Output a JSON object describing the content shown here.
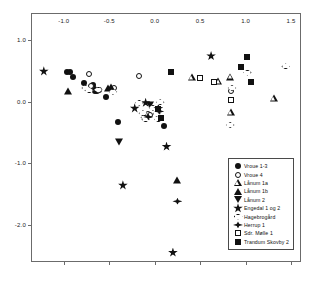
{
  "chart_data": {
    "type": "scatter",
    "title": "",
    "xlabel": "",
    "ylabel": "",
    "xlim": [
      -1.35,
      1.62
    ],
    "ylim": [
      -2.62,
      1.42
    ],
    "grid": false,
    "legend_position": "bottom-right",
    "xticks": [
      "-1.0",
      "-0.5",
      "0.0",
      "0.5",
      "1.0",
      "1.5"
    ],
    "xtickvalues": [
      -1.0,
      -0.5,
      0.0,
      0.5,
      1.0,
      1.5
    ],
    "yticks": [
      "1.0",
      "0.0",
      "-1.0",
      "-2.0"
    ],
    "ytickvalues": [
      1.0,
      0.0,
      -1.0,
      -2.0
    ],
    "series": [
      {
        "name": "Vroue 1-3",
        "marker": "circle-filled",
        "points": [
          [
            -0.96,
            0.48
          ],
          [
            -0.93,
            0.48
          ],
          [
            -0.9,
            0.4
          ],
          [
            -0.78,
            0.3
          ],
          [
            -0.68,
            0.26
          ],
          [
            -0.67,
            0.2
          ],
          [
            -0.66,
            0.17
          ],
          [
            -0.63,
            0.17
          ],
          [
            -0.61,
            0.19
          ],
          [
            -0.54,
            0.08
          ],
          [
            -0.46,
            0.19
          ],
          [
            -0.4,
            -0.33
          ],
          [
            0.1,
            -0.39
          ]
        ]
      },
      {
        "name": "Vroue 4",
        "marker": "circle-open",
        "points": [
          [
            -0.72,
            0.44
          ],
          [
            -0.7,
            0.25
          ],
          [
            -0.45,
            0.22
          ],
          [
            -0.17,
            0.42
          ],
          [
            -0.07,
            -0.2
          ],
          [
            -0.05,
            -0.22
          ],
          [
            0.84,
            0.17
          ]
        ]
      },
      {
        "name": "Lånum 1a",
        "marker": "triangle-open",
        "points": [
          [
            0.41,
            0.4
          ],
          [
            0.7,
            0.44
          ],
          [
            0.83,
            0.63
          ],
          [
            0.84,
            0.17
          ],
          [
            1.31,
            0.51
          ]
        ]
      },
      {
        "name": "Lånum 1b",
        "marker": "triangle-filled",
        "points": [
          [
            -0.95,
            0.17
          ],
          [
            -0.51,
            0.22
          ],
          [
            -0.48,
            0.24
          ],
          [
            0.25,
            -1.27
          ]
        ]
      },
      {
        "name": "Lånum 2",
        "marker": "triangle-down-filled",
        "points": [
          [
            -0.39,
            -0.65
          ],
          [
            -0.05,
            -0.05
          ]
        ]
      },
      {
        "name": "Engedal 1 og 2",
        "marker": "star-filled",
        "points": [
          [
            -1.22,
            0.49
          ],
          [
            -0.22,
            -0.11
          ],
          [
            -0.1,
            -0.02
          ],
          [
            0.13,
            -0.73
          ],
          [
            0.2,
            -2.45
          ],
          [
            0.62,
            0.74
          ],
          [
            -0.35,
            -1.36
          ]
        ]
      },
      {
        "name": "Hagebrogård",
        "marker": "diamond-open",
        "points": [
          [
            -0.76,
            0.22
          ],
          [
            -0.72,
            0.18
          ],
          [
            -0.62,
            0.19
          ],
          [
            -0.46,
            0.16
          ],
          [
            -0.17,
            -0.02
          ],
          [
            -0.13,
            -0.19
          ],
          [
            -0.11,
            -0.26
          ],
          [
            -0.1,
            -0.29
          ],
          [
            -0.02,
            -0.1
          ],
          [
            0.02,
            -0.2
          ],
          [
            0.04,
            -0.29
          ],
          [
            0.06,
            -0.01
          ],
          [
            0.83,
            -0.38
          ],
          [
            0.85,
            0.22
          ],
          [
            1.02,
            0.47
          ],
          [
            1.44,
            0.57
          ]
        ]
      },
      {
        "name": "Herrup 1",
        "marker": "herrup-diamond-filled",
        "points": [
          [
            -0.07,
            -0.25
          ],
          [
            0.04,
            -0.1
          ],
          [
            0.05,
            -0.16
          ],
          [
            0.25,
            -1.62
          ]
        ]
      },
      {
        "name": "Sdr. Mølle 1",
        "marker": "square-open",
        "points": [
          [
            0.5,
            0.38
          ],
          [
            0.65,
            0.31
          ],
          [
            0.84,
            0.02
          ]
        ]
      },
      {
        "name": "Trandum Skovby 2",
        "marker": "square-filled",
        "points": [
          [
            0.04,
            -0.12
          ],
          [
            0.07,
            -0.27
          ],
          [
            0.18,
            0.48
          ],
          [
            0.95,
            0.56
          ],
          [
            1.01,
            0.73
          ],
          [
            1.06,
            0.31
          ]
        ]
      }
    ]
  },
  "legend": {
    "items": [
      {
        "label": "Vroue 1-3",
        "marker": "circle-filled"
      },
      {
        "label": "Vroue 4",
        "marker": "circle-open"
      },
      {
        "label": "Lånum 1a",
        "marker": "triangle-open"
      },
      {
        "label": "Lånum 1b",
        "marker": "triangle-filled"
      },
      {
        "label": "Lånum 2",
        "marker": "triangle-down-filled"
      },
      {
        "label": "Engedal 1 og 2",
        "marker": "star-filled"
      },
      {
        "label": "Hagebrogård",
        "marker": "diamond-open"
      },
      {
        "label": "Herrup 1",
        "marker": "herrup-diamond-filled"
      },
      {
        "label": "Sdr. Mølle 1",
        "marker": "square-open"
      },
      {
        "label": "Trandum Skovby 2",
        "marker": "square-filled"
      }
    ]
  },
  "colors": {
    "marker": "#111111",
    "frame": "#6b6b6b",
    "background": "#ffffff"
  }
}
